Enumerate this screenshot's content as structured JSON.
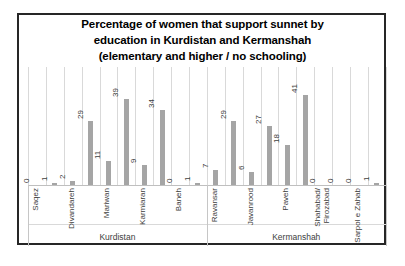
{
  "chart_data": {
    "type": "bar",
    "title": "Percentage of women that support sunnet by education in Kurdistan and Kermanshah (elementary and higher / no schooling)",
    "title_lines": [
      "Percentage of women that support sunnet by",
      "education in Kurdistan and Kermanshah",
      "(elementary and higher / no schooling)"
    ],
    "bars_per_city": 2,
    "bars_per_city_note": "elementary and higher / no schooling",
    "groups": [
      {
        "label": "Kurdistan",
        "cities": [
          {
            "name": "Saqez",
            "values": [
              0,
              1
            ]
          },
          {
            "name": "Divandareh",
            "values": [
              2,
              29
            ]
          },
          {
            "name": "Mariwan",
            "values": [
              11,
              39
            ]
          },
          {
            "name": "Karmiaran",
            "values": [
              9,
              34
            ]
          },
          {
            "name": "Baneh",
            "values": [
              0,
              1
            ]
          }
        ]
      },
      {
        "label": "Kermanshah",
        "cities": [
          {
            "name": "Ravansar",
            "values": [
              7,
              29
            ]
          },
          {
            "name": "Javanrood",
            "values": [
              6,
              27
            ]
          },
          {
            "name": "Paveh",
            "values": [
              18,
              41
            ]
          },
          {
            "name": "Shahabad/ Firozabad",
            "name_lines": [
              "Shahabad/",
              "Firozabad"
            ],
            "values": [
              0,
              0
            ]
          },
          {
            "name": "Sarpol e Zahab",
            "values": [
              0,
              1
            ]
          }
        ]
      }
    ],
    "ylim": [
      0,
      41
    ],
    "value_labels_shown": true,
    "grid": true,
    "legend": "none",
    "colors": {
      "bar": "#a5a5a5",
      "gridline": "#d9d9d9",
      "axis_line": "#bfbfbf",
      "label_text": "#404040",
      "title_text": "#000000",
      "frame_border": "#262626"
    }
  }
}
